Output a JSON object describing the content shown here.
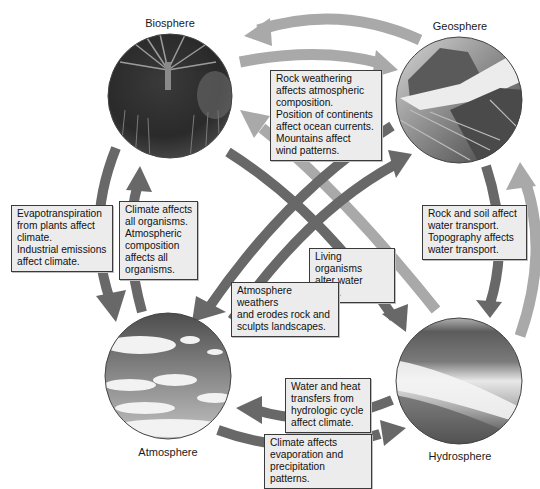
{
  "diagram": {
    "spheres": {
      "biosphere": {
        "label": "Biosphere"
      },
      "geosphere": {
        "label": "Geosphere"
      },
      "atmosphere": {
        "label": "Atmosphere"
      },
      "hydrosphere": {
        "label": "Hydrosphere"
      }
    },
    "notes": {
      "geo_to_atmo": [
        "Rock weathering",
        "affects atmospheric",
        "composition.",
        "Position of continents",
        "affect ocean currents.",
        "Mountains affect",
        "wind patterns."
      ],
      "bio_to_atmo": [
        "Evapotranspiration",
        "from plants affect",
        "climate.",
        "Industrial emissions",
        "affect climate."
      ],
      "atmo_to_bio": [
        "Climate affects",
        "all organisms.",
        "Atmospheric",
        "composition",
        "affects all",
        "organisms."
      ],
      "geo_to_hydro": [
        "Rock and soil affect",
        "water transport.",
        "Topography affects",
        "water transport."
      ],
      "bio_to_hydro": [
        "Living organisms",
        "alter water cycle."
      ],
      "atmo_to_geo": [
        "Atmosphere weathers",
        "and erodes rock and",
        "sculpts landscapes."
      ],
      "hydro_to_atmo": [
        "Water and heat",
        "transfers from",
        "hydrologic cycle",
        "affect climate."
      ],
      "atmo_to_hydro": [
        "Climate affects",
        "evaporation and",
        "precipitation patterns."
      ]
    },
    "colors": {
      "dark_arrow": "#686868",
      "light_arrow": "#a9a9a9",
      "note_fill": "#ececec",
      "note_border": "#3a3a3a"
    }
  }
}
